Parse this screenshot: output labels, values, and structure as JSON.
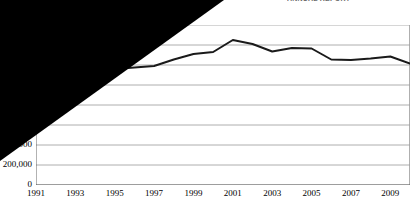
{
  "header": {
    "text": "ANNUAL REPORT"
  },
  "chart_data": {
    "type": "line",
    "title": "",
    "subtitle": "",
    "xlabel": "",
    "ylabel": "",
    "grid": true,
    "legend": "none",
    "xlim": [
      1991,
      2010
    ],
    "ylim": [
      0,
      1600000
    ],
    "ytick_step": 200000,
    "x_tick_labels": [
      "1991",
      "1993",
      "1995",
      "1997",
      "1999",
      "2001",
      "2003",
      "2005",
      "2007",
      "2009"
    ],
    "x_minor_ticks": [
      1992,
      1994,
      1996,
      1998,
      2000,
      2002,
      2004,
      2006,
      2008,
      2010
    ],
    "y_tick_labels": [
      "0",
      "200,000",
      "400,000",
      "600,000",
      "800,000",
      "1,000,000",
      "1,200,000",
      "1,400,000",
      "1,600,000"
    ],
    "y_tick_labels_visible": [
      "0",
      "200,000"
    ],
    "y_tick_label_clipped": "00",
    "series": [
      {
        "name": "Value",
        "color": "#1a1a1a",
        "x": [
          1991,
          1992,
          1993,
          1994,
          1995,
          1996,
          1997,
          1998,
          1999,
          2000,
          2001,
          2002,
          2003,
          2004,
          2005,
          2006,
          2007,
          2008,
          2009,
          2010
        ],
        "values": [
          1120000,
          1130000,
          1140000,
          1150000,
          1160000,
          1175000,
          1190000,
          1255000,
          1310000,
          1330000,
          1450000,
          1410000,
          1335000,
          1370000,
          1365000,
          1255000,
          1250000,
          1265000,
          1285000,
          1215000
        ]
      }
    ],
    "occlusion": {
      "shape": "triangle",
      "color": "#000000",
      "description": "solid black triangle covering upper-left portion of the figure"
    }
  }
}
